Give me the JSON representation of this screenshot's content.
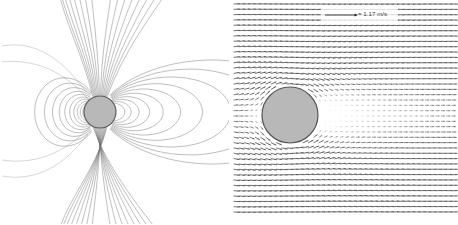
{
  "figure": {
    "width": 458,
    "height": 224,
    "background": "#ffffff",
    "panel_count": 2
  },
  "legend": {
    "scale_label": "= 1.17 m/s",
    "scale_value": 1.17,
    "scale_units": "m/s",
    "bar_x_start": 325,
    "bar_x_end": 356,
    "bar_y": 15
  },
  "colors": {
    "sphere_fill": "#b8b8b8",
    "sphere_stroke": "#555555",
    "streamline": "#6e6e6e",
    "vector": "#4a4a4a",
    "background": "#ffffff",
    "label_text": "#3a3a3a"
  },
  "panel_left": {
    "name": "streamline-contour-panel",
    "sphere": {
      "cx": 100,
      "cy": 112,
      "r": 16
    },
    "description": "dipole field lines around sphere",
    "chart_data": {
      "type": "line",
      "title": "",
      "xlabel": "",
      "ylabel": "",
      "grid": false,
      "legend": "none"
    }
  },
  "panel_right": {
    "name": "velocity-vector-panel",
    "sphere": {
      "cx": 290,
      "cy": 115,
      "r": 28
    },
    "field_bounds": {
      "x0": 234,
      "y0": 4,
      "x1": 452,
      "y1": 212
    },
    "grid_cols": 42,
    "grid_rows": 40,
    "description": "velocity vector field around sphere with wake"
  },
  "chart_data": [
    {
      "type": "line",
      "name": "dipole-streamlines",
      "title": "",
      "xlabel": "",
      "ylabel": "",
      "grid": false,
      "sphere_center": [
        100,
        112
      ],
      "sphere_radius": 16,
      "left_loop_scales": [
        0.3,
        0.45,
        0.62,
        0.82,
        1.05,
        1.32,
        1.62,
        1.98,
        2.4,
        2.9
      ],
      "right_loop_scales": [
        0.32,
        0.5,
        0.72,
        1.0,
        1.35,
        1.78,
        2.3,
        2.95,
        3.7,
        4.55
      ],
      "open_line_count": 16,
      "notes": "nested closed dipole loops, compressed on left, extended on right"
    },
    {
      "type": "scatter",
      "name": "velocity-vector-field",
      "title": "",
      "xlabel": "",
      "ylabel": "",
      "grid": false,
      "scale_reference": 1.17,
      "scale_units": "m/s",
      "sphere_center": [
        290,
        115
      ],
      "sphere_radius": 28,
      "max_magnitude": 1.17,
      "wake_magnitude": 0.12,
      "upstream_magnitude": 0.95,
      "notes": "arrows dense and dark upstream/around sphere, faint in downstream wake to the right"
    }
  ]
}
